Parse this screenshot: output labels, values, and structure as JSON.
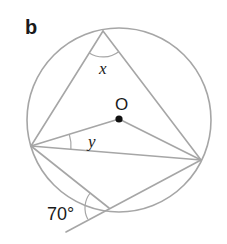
{
  "figure": {
    "part_label": "b",
    "center_label": "O",
    "angle_x_label": "x",
    "angle_y_label": "y",
    "given_angle_label": "70°"
  },
  "geometry": {
    "circle": {
      "cx": 119,
      "cy": 120,
      "r": 92
    },
    "points": {
      "A_top": [
        103,
        31
      ],
      "B_left": [
        31,
        146
      ],
      "C_right": [
        201,
        160
      ],
      "D_bottom": [
        109,
        208
      ],
      "O_center": [
        119,
        119
      ],
      "T_tangent_end": [
        66,
        232
      ]
    },
    "segments": [
      [
        "A_top",
        "B_left"
      ],
      [
        "A_top",
        "C_right"
      ],
      [
        "B_left",
        "C_right"
      ],
      [
        "B_left",
        "O_center"
      ],
      [
        "O_center",
        "C_right"
      ],
      [
        "B_left",
        "D_bottom"
      ],
      [
        "T_tangent_end",
        "C_right"
      ]
    ],
    "line_color": "#a6a6a6",
    "text_color": "#1a1a1a"
  }
}
